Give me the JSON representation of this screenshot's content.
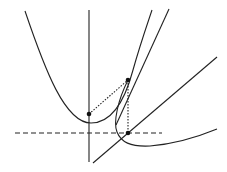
{
  "diagram": {
    "colors": {
      "stroke": "#222222",
      "background": "#ffffff"
    },
    "elements": {
      "parabola": {
        "vertex": [
          91,
          123
        ],
        "left_top": [
          25,
          11
        ],
        "right_top": [
          152,
          10
        ]
      },
      "vertical_axis": {
        "x": 89,
        "y_top": 10,
        "y_bottom": 162
      },
      "tangent_line": {
        "from": [
          107,
          144
        ],
        "to": [
          169,
          9
        ]
      },
      "diagonal_line": {
        "from": [
          93,
          163
        ],
        "to": [
          217,
          57
        ]
      },
      "dashed_line": {
        "y": 133,
        "x_from": 15,
        "x_to": 162
      },
      "second_curve": {
        "start": [
          128,
          80
        ],
        "leftmost": [
          116,
          127
        ],
        "end": [
          217,
          129
        ]
      },
      "points": [
        {
          "name": "axis-point",
          "x": 89,
          "y": 114
        },
        {
          "name": "tangent-point",
          "x": 128,
          "y": 80
        },
        {
          "name": "intersection-point",
          "x": 128,
          "y": 133
        }
      ]
    }
  }
}
